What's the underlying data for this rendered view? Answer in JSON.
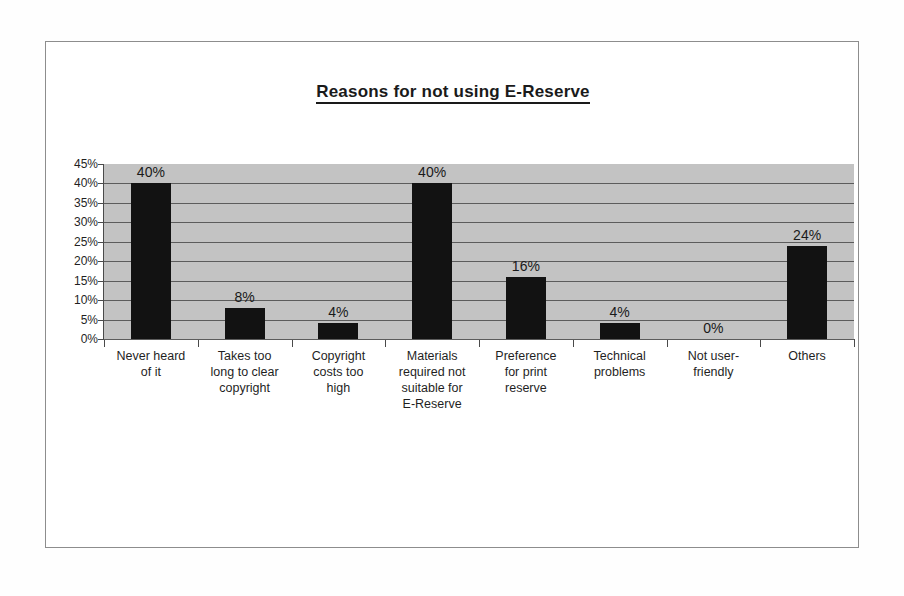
{
  "chart_data": {
    "type": "bar",
    "title": "Reasons for not using E-Reserve",
    "xlabel": "",
    "ylabel": "",
    "ylim": [
      0,
      45
    ],
    "ytick_labels": [
      "45%",
      "40%",
      "35%",
      "30%",
      "25%",
      "20%",
      "15%",
      "10%",
      "5%",
      "0%"
    ],
    "ytick_values": [
      45,
      40,
      35,
      30,
      25,
      20,
      15,
      10,
      5,
      0
    ],
    "grid": true,
    "legend": false,
    "categories": [
      "Never heard of it",
      "Takes too long to clear copyright",
      "Copyright costs too high",
      "Materials required not suitable for E-Reserve",
      "Preference for print reserve",
      "Technical problems",
      "Not user-friendly",
      "Others"
    ],
    "category_lines": [
      [
        "Never heard",
        "of it"
      ],
      [
        "Takes too",
        "long to clear",
        "copyright"
      ],
      [
        "Copyright",
        "costs too",
        "high"
      ],
      [
        "Materials",
        "required not",
        "suitable for",
        "E-Reserve"
      ],
      [
        "Preference",
        "for print",
        "reserve"
      ],
      [
        "Technical",
        "problems"
      ],
      [
        "Not user-",
        "friendly"
      ],
      [
        "Others"
      ]
    ],
    "values": [
      40,
      8,
      4,
      40,
      16,
      4,
      0,
      24
    ],
    "data_labels": [
      "40%",
      "8%",
      "4%",
      "40%",
      "16%",
      "4%",
      "0%",
      "24%"
    ],
    "bar_color": "#121212",
    "plot_background": "#c3c3c3",
    "gridline_color": "#5c5c5c",
    "axis_color": "#4a4a4a"
  }
}
